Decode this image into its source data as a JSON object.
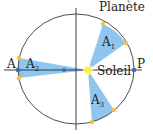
{
  "diagram": {
    "labels": {
      "planet": "Planète",
      "sun": "Soleil",
      "aphelion": "A",
      "perihelion": "P",
      "area1_base": "A",
      "area1_sub": "1",
      "area2_base": "A",
      "area2_sub": "2",
      "area3_base": "A",
      "area3_sub": "3"
    },
    "colors": {
      "orbit": "#3a3a3a",
      "axis": "#2a2a2a",
      "wedge_fill": "#8fc6ef",
      "sun": "#fff03a",
      "sun_glow": "#fff7a8",
      "planet_points": "#f5c04a",
      "focus_points": "#3d6fb0"
    },
    "orbit": {
      "cx": 76,
      "cy": 69,
      "rx": 58,
      "ry": 55
    },
    "sun_position": {
      "x": 88,
      "y": 70
    },
    "empty_focus": {
      "x": 64,
      "y": 70
    },
    "wedges": [
      {
        "name": "A1",
        "p1": [
          103,
          24
        ],
        "p2": [
          126,
          43
        ]
      },
      {
        "name": "A2",
        "p1": [
          19,
          58
        ],
        "p2": [
          19,
          78
        ]
      },
      {
        "name": "A3",
        "p1": [
          92,
          122
        ],
        "p2": [
          114,
          110
        ]
      }
    ]
  }
}
